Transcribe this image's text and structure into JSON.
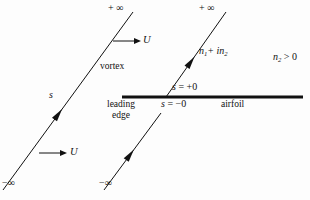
{
  "figure": {
    "background_color": "#fdfdfd",
    "stroke_color": "#111111",
    "labels": {
      "infinity_top_left": "+ ∞",
      "infinity_top_right": "+ ∞",
      "infinity_bottom_left": "−∞",
      "infinity_bottom_right": "−∞",
      "velocity_upper": "U",
      "velocity_lower": "U",
      "vortex": "vortex",
      "arclength": "s",
      "normal_complex": "n₁+ in₂",
      "normal_condition": "n₂ > 0",
      "s_plus_zero": "s = +0",
      "s_minus_zero": "s = −0",
      "airfoil": "airfoil",
      "leading_edge_line1": "leading",
      "leading_edge_line2": "edge"
    },
    "parts": {
      "normal_complex_base1": "n",
      "normal_complex_sub1": "1",
      "normal_complex_mid": "+ i",
      "normal_complex_base2": "n",
      "normal_complex_sub2": "2",
      "normal_condition_base": "n",
      "normal_condition_sub": "2",
      "normal_condition_rel": " > 0",
      "s_plus_var": "s",
      "s_plus_rest": " = +0",
      "s_minus_var": "s",
      "s_minus_rest": " = −0"
    },
    "geometry": {
      "airfoil_line": {
        "x1": 122,
        "y1": 97,
        "x2": 303,
        "y2": 97,
        "width": 3.2
      },
      "vortex_line_left": {
        "x1": 3,
        "y1": 190,
        "x2": 133,
        "y2": 12
      },
      "vortex_line_right_lower": {
        "x1": 104,
        "y1": 190,
        "x2": 161,
        "y2": 113
      },
      "vortex_line_right_upper": {
        "x1": 166,
        "y1": 97,
        "x2": 226,
        "y2": 12
      },
      "velocity_arrow_upper": {
        "x1": 113,
        "y1": 41,
        "x2": 141,
        "y2": 41
      },
      "velocity_arrow_lower": {
        "x1": 39,
        "y1": 153,
        "x2": 67,
        "y2": 153
      }
    }
  }
}
